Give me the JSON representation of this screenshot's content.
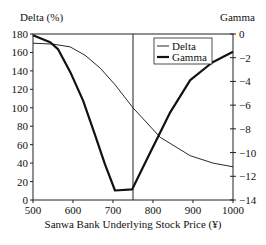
{
  "chart_data": {
    "type": "line",
    "title": "",
    "xlabel": "Sanwa Bank Underlying Stock Price (¥)",
    "ylabel_left": "Delta (%)",
    "ylabel_right": "Gamma",
    "xlim": [
      500,
      1000
    ],
    "ylim_left": [
      0,
      180
    ],
    "ylim_right": [
      -14,
      0
    ],
    "x_ticks": [
      500,
      600,
      700,
      800,
      900,
      1000
    ],
    "y_ticks_left": [
      0,
      20,
      40,
      60,
      80,
      100,
      120,
      140,
      160,
      180
    ],
    "y_ticks_right": [
      0,
      -2,
      -4,
      -6,
      -8,
      -10,
      -12,
      -14
    ],
    "grid": false,
    "legend_position": "upper center",
    "vertical_line_x": 750,
    "series": [
      {
        "name": "Delta",
        "axis": "left",
        "style": "thin",
        "x": [
          500,
          550,
          593,
          630,
          668,
          705,
          750,
          818,
          893,
          950,
          1000
        ],
        "values": [
          170,
          169,
          166,
          157,
          143,
          125,
          100,
          68,
          48,
          40,
          36
        ]
      },
      {
        "name": "Gamma",
        "axis": "right",
        "style": "thick",
        "x": [
          500,
          543,
          563,
          593,
          625,
          655,
          680,
          705,
          748,
          790,
          843,
          893,
          948,
          1000
        ],
        "values": [
          -0.1,
          -0.7,
          -1.3,
          -3.2,
          -5.6,
          -8.5,
          -11.0,
          -13.2,
          -13.1,
          -10.2,
          -6.6,
          -3.9,
          -2.4,
          -1.5
        ]
      }
    ]
  }
}
